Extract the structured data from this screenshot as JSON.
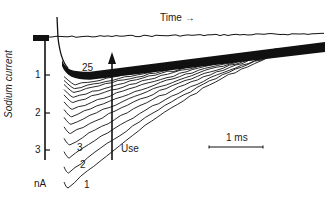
{
  "chart_data": {
    "type": "line",
    "title": "",
    "xlabel": "Time →",
    "ylabel": "Sodium current",
    "yunit": "nA",
    "yticks": [
      1,
      2,
      3
    ],
    "ylim": [
      0,
      4
    ],
    "y_inverted": true,
    "scale_bar": {
      "label": "1 ms",
      "length_ms": 1
    },
    "annotation_arrow": {
      "label": "Use",
      "direction": "up",
      "meaning": "successive traces with repeated use decrease in peak amplitude"
    },
    "trace_labels": [
      "1",
      "2",
      "3",
      "25"
    ],
    "series": [
      {
        "name": "1",
        "peak_nA": 4.0
      },
      {
        "name": "2",
        "peak_nA": 3.6
      },
      {
        "name": "3",
        "peak_nA": 3.2
      },
      {
        "name": "4",
        "peak_nA": 2.85
      },
      {
        "name": "5",
        "peak_nA": 2.55
      },
      {
        "name": "6",
        "peak_nA": 2.3
      },
      {
        "name": "7",
        "peak_nA": 2.1
      },
      {
        "name": "8",
        "peak_nA": 1.9
      },
      {
        "name": "9",
        "peak_nA": 1.72
      },
      {
        "name": "10",
        "peak_nA": 1.58
      },
      {
        "name": "11",
        "peak_nA": 1.45
      },
      {
        "name": "12",
        "peak_nA": 1.35
      },
      {
        "name": "13",
        "peak_nA": 1.25
      },
      {
        "name": "25",
        "peak_nA": 0.9
      }
    ],
    "decay_to_nA_at_end": 0.2,
    "x_range_ms": [
      0,
      4.9
    ],
    "grid": false,
    "legend": "none"
  },
  "labels": {
    "time_label": "Time →",
    "y_axis_label": "Sodium current",
    "unit": "nA",
    "tick_1": "1",
    "tick_2": "2",
    "tick_3": "3",
    "trace_1": "1",
    "trace_2": "2",
    "trace_3": "3",
    "trace_25": "25",
    "use_label": "Use",
    "scale_label": "1 ms"
  }
}
